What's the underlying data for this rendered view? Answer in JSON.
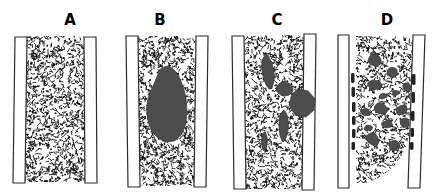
{
  "figure": {
    "type": "diagram",
    "colors": {
      "background": "#ffffff",
      "wall_fill": "#ffffff",
      "wall_stroke": "#2b2b2b",
      "stipple": "#0d0d0d",
      "blob": "#4d4d4d",
      "blob_stroke": "#3a3a3a",
      "dash": "#222222",
      "label": "#000000"
    },
    "panels": [
      {
        "label": "A",
        "seed": 11,
        "stipple_count": 1050,
        "stipple_region": "M27,36 L84,36 L85,182 L25,182 Z",
        "stipple_bbox": [
          25,
          36,
          60,
          146
        ],
        "walls": [
          {
            "name": "left-vessel-wall",
            "path": "M15,37 L27,37 L25,183 L13,183 Z"
          },
          {
            "name": "right-vessel-wall",
            "path": "M84,37 L96,37 L97,183 L85,183 Z"
          }
        ],
        "blobs": [],
        "dashes": []
      },
      {
        "label": "B",
        "seed": 22,
        "stipple_count": 1050,
        "stipple_region": "M138,36 L196,36 L194,186 L140,186 Z",
        "stipple_bbox": [
          138,
          36,
          58,
          150
        ],
        "walls": [
          {
            "name": "left-vessel-wall",
            "path": "M126,36 L138,36 L140,187 L128,187 Z"
          },
          {
            "name": "right-vessel-wall",
            "path": "M196,36 L208,36 L206,187 L194,187 Z"
          }
        ],
        "blobs": [
          {
            "path": "M164,67 C158,70 157,78 153,86 C148,95 146,104 147,114 C148,127 154,138 164,141 C174,144 182,137 185,126 C188,114 187,100 184,90 C181,79 176,70 170,67 C168,66 166,66 164,67 Z"
          }
        ],
        "dashes": []
      },
      {
        "label": "C",
        "seed": 33,
        "stipple_count": 1030,
        "stipple_region": "M244,36 L304,35 L302,189 L246,189 Z",
        "stipple_bbox": [
          244,
          35,
          60,
          154
        ],
        "walls": [
          {
            "name": "left-vessel-wall",
            "path": "M232,36 L244,36 L246,189 L234,189 Z"
          },
          {
            "name": "right-vessel-wall",
            "path": "M304,34 L316,34 L314,190 L302,190 Z"
          }
        ],
        "blobs": [
          {
            "path": "M266,54 C270,57 273,65 274,73 C275,81 273,87 270,89 C266,87 263,79 262,70 C261,62 263,57 266,54 Z"
          },
          {
            "path": "M279,84 C283,81 289,82 292,86 C294,89 293,93 289,95 C284,97 279,95 277,91 C276,88 277,86 279,84 Z"
          },
          {
            "path": "M298,89 L308,91 L315,99 L314,110 L306,117 L295,115 L289,105 L292,94 Z"
          },
          {
            "path": "M284,110 C288,114 289,122 288,130 C287,137 285,141 283,142 C281,140 279,133 279,125 C279,117 281,112 284,110 Z"
          },
          {
            "path": "M265,132 C267,135 268,140 267,145 C266,149 265,151 264,151 C262,149 261,143 262,138 C262,134 263,132 265,132 Z"
          }
        ],
        "dashes": []
      },
      {
        "label": "D",
        "seed": 44,
        "stipple_count": 900,
        "stipple_region": "M356,36 L413,36 L409,135 C404,160 388,176 366,183 L356,184 Z",
        "stipple_bbox": [
          356,
          36,
          57,
          148
        ],
        "walls": [
          {
            "name": "left-vessel-wall",
            "path": "M338,35 L349,35 L349,188 L338,188 Z"
          },
          {
            "name": "right-vessel-wall",
            "path": "M413,35 L425,35 L420,188 L408,188 Z"
          }
        ],
        "blobs": [
          {
            "cx": 375,
            "cy": 60,
            "rx": 8,
            "ry": 6
          },
          {
            "cx": 392,
            "cy": 73,
            "rx": 6,
            "ry": 5
          },
          {
            "cx": 374,
            "cy": 85,
            "rx": 7,
            "ry": 5
          },
          {
            "cx": 407,
            "cy": 87,
            "rx": 5,
            "ry": 5
          },
          {
            "cx": 383,
            "cy": 96,
            "rx": 4,
            "ry": 3
          },
          {
            "cx": 396,
            "cy": 93,
            "rx": 4,
            "ry": 3
          },
          {
            "cx": 381,
            "cy": 109,
            "rx": 7,
            "ry": 6
          },
          {
            "cx": 401,
            "cy": 110,
            "rx": 6,
            "ry": 5
          },
          {
            "cx": 365,
            "cy": 112,
            "rx": 5,
            "ry": 4
          },
          {
            "cx": 405,
            "cy": 122,
            "rx": 5,
            "ry": 5
          },
          {
            "cx": 387,
            "cy": 124,
            "rx": 5,
            "ry": 4
          },
          {
            "cx": 368,
            "cy": 128,
            "rx": 4,
            "ry": 3
          },
          {
            "cx": 373,
            "cy": 139,
            "rx": 7,
            "ry": 6
          },
          {
            "cx": 394,
            "cy": 145,
            "rx": 6,
            "ry": 5
          }
        ],
        "dashes": [
          {
            "x": 351,
            "y": 73,
            "w": 3.5,
            "h": 10
          },
          {
            "x": 351.5,
            "y": 87,
            "w": 3.5,
            "h": 10
          },
          {
            "x": 352,
            "y": 102,
            "w": 3.5,
            "h": 10
          },
          {
            "x": 352,
            "y": 116,
            "w": 3.5,
            "h": 9
          },
          {
            "x": 352,
            "y": 129,
            "w": 3.5,
            "h": 9
          },
          {
            "x": 351.5,
            "y": 142,
            "w": 3.5,
            "h": 8
          },
          {
            "x": 412,
            "y": 74,
            "w": 3.5,
            "h": 11
          },
          {
            "x": 411.5,
            "y": 92,
            "w": 3.5,
            "h": 11
          },
          {
            "x": 411,
            "y": 111,
            "w": 3.5,
            "h": 10
          },
          {
            "x": 410.5,
            "y": 128,
            "w": 3.5,
            "h": 9
          },
          {
            "x": 410,
            "y": 142,
            "w": 3.5,
            "h": 8
          }
        ]
      }
    ]
  }
}
